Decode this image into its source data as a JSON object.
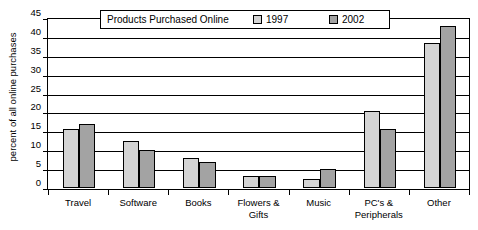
{
  "chart_data": {
    "type": "bar",
    "title": "Products Purchased Online",
    "xlabel": "",
    "ylabel": "percent of all online purchases",
    "ylim": [
      0,
      45
    ],
    "ytick_step": 5,
    "yticks": [
      "45",
      "40",
      "35",
      "30",
      "25",
      "20",
      "15",
      "10",
      "5",
      "0"
    ],
    "grid": true,
    "legend_position": "top-center",
    "categories": [
      "Travel",
      "Software",
      "Books",
      "Flowers & Gifts",
      "Music",
      "PC's & Peripherals",
      "Other"
    ],
    "category_lines": [
      [
        "Travel"
      ],
      [
        "Software"
      ],
      [
        "Books"
      ],
      [
        "Flowers &",
        "Gifts"
      ],
      [
        "Music"
      ],
      [
        "PC's &",
        "Peripherals"
      ],
      [
        "Other"
      ]
    ],
    "series": [
      {
        "name": "1997",
        "color": "#d4d4d4",
        "values": [
          15.7,
          12.5,
          8.0,
          3.3,
          2.3,
          20.5,
          38.5
        ]
      },
      {
        "name": "2002",
        "color": "#a3a3a3",
        "values": [
          17.0,
          10.0,
          6.8,
          3.3,
          5.0,
          15.5,
          43.0
        ]
      }
    ]
  },
  "legend": {
    "entries": [
      {
        "label": "1997"
      },
      {
        "label": "2002"
      }
    ]
  },
  "colors": {
    "series_1997": "#d4d4d4",
    "series_2002": "#a3a3a3",
    "axis": "#000000",
    "background": "#ffffff"
  }
}
